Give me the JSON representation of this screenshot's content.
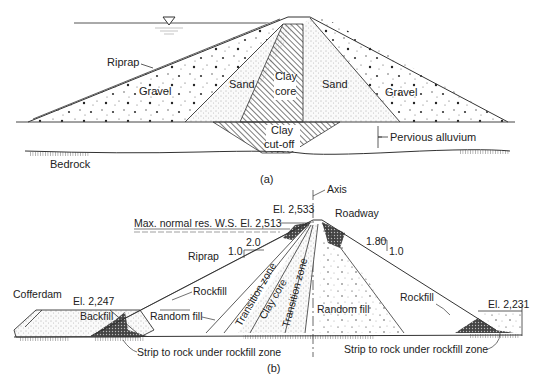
{
  "figure_a": {
    "caption": "(a)",
    "labels": {
      "riprap": "Riprap",
      "gravel_left": "Gravel",
      "sand_left": "Sand",
      "clay_core_line1": "Clay",
      "clay_core_line2": "core",
      "sand_right": "Sand",
      "gravel_right": "Gravel",
      "clay_cutoff_line1": "Clay",
      "clay_cutoff_line2": "cut-off",
      "pervious_alluvium": "Pervious alluvium",
      "bedrock": "Bedrock"
    },
    "icons": [
      "water-surface-triangle-icon"
    ]
  },
  "figure_b": {
    "caption": "(b)",
    "labels": {
      "axis": "Axis",
      "crest_elevation": "El. 2,533",
      "roadway": "Roadway",
      "max_ws": "Max. normal res. W.S. El. 2,513",
      "upstream_slope_h": "2.0",
      "upstream_slope_v": "1.0",
      "riprap": "Riprap",
      "downstream_slope_h": "1.80",
      "downstream_slope_v": "1.0",
      "cofferdam": "Cofferdam",
      "cofferdam_elevation": "El. 2,247",
      "backfill": "Backfill",
      "rockfill_left": "Rockfill",
      "random_fill_left": "Random fill",
      "transition_zone_left": "Transition zone",
      "clay_core": "Clay core",
      "transition_zone_right": "Transition zone",
      "random_fill_right": "Random fill",
      "rockfill_right": "Rockfill",
      "downstream_elevation": "El. 2,231",
      "strip_left": "Strip to rock under rockfill zone",
      "strip_right": "Strip to rock under rockfill zone"
    }
  }
}
